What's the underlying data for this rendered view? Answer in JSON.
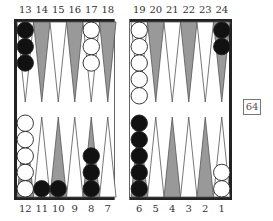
{
  "board": {
    "top_labels": [
      "13",
      "14",
      "15",
      "16",
      "17",
      "18",
      "19",
      "20",
      "21",
      "22",
      "23",
      "24"
    ],
    "bottom_labels": [
      "12",
      "11",
      "10",
      "9",
      "8",
      "7",
      "6",
      "5",
      "4",
      "3",
      "2",
      "1"
    ],
    "points": {
      "13": {
        "color": "black",
        "count": 3
      },
      "17": {
        "color": "white",
        "count": 3
      },
      "19": {
        "color": "white",
        "count": 5
      },
      "24": {
        "color": "black",
        "count": 2
      },
      "12": {
        "color": "white",
        "count": 5
      },
      "11": {
        "color": "black",
        "count": 1
      },
      "10": {
        "color": "black",
        "count": 1
      },
      "8": {
        "color": "black",
        "count": 3
      },
      "6": {
        "color": "black",
        "count": 5
      },
      "1": {
        "color": "white",
        "count": 2
      }
    },
    "colors": {
      "dark_point": "#999999",
      "light_point": "#ffffff",
      "black_checker": "#111111",
      "white_checker": "#ffffff",
      "frame": "#222222"
    }
  },
  "cube": {
    "value": "64"
  }
}
